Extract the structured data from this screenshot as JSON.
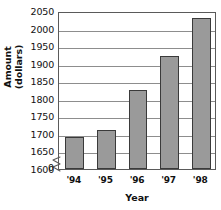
{
  "chart_data": {
    "type": "bar",
    "title": "",
    "xlabel": "Year",
    "ylabel": "Amount (dollars)",
    "ylabel_line1": "Amount",
    "ylabel_line2": "(dollars)",
    "categories": [
      "'94",
      "'95",
      "'96",
      "'97",
      "'98"
    ],
    "values": [
      1690,
      1710,
      1825,
      1922,
      2030
    ],
    "ylim": [
      1600,
      2050
    ],
    "ytick_labels": [
      "2050",
      "2000",
      "1950",
      "1900",
      "1850",
      "1800",
      "1750",
      "1700",
      "1650",
      "1600"
    ],
    "ytick_values": [
      2050,
      2000,
      1950,
      1900,
      1850,
      1800,
      1750,
      1700,
      1650,
      1600
    ],
    "zero_label": "0",
    "axis_break": true,
    "axis_break_between": [
      0,
      1600
    ],
    "grid": true,
    "grid_orientation": "horizontal",
    "legend": false,
    "bar_fill_color": "#9a9a9a",
    "bar_border_color": "#3a3a3a",
    "gridline_color": "#8d8d8d",
    "axis_color": "#5a5a5a",
    "text_color": "#111111",
    "background_color": "#ffffff"
  }
}
